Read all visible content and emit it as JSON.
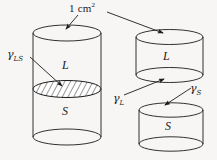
{
  "figure": {
    "type": "scientific-diagram",
    "background_color": "#f7f6f4",
    "stroke_color": "#1b1b1b",
    "labels": {
      "area": "1 cm",
      "area_exponent": "2",
      "gamma_symbol": "γ",
      "gamma_ls_sub": "LS",
      "gamma_l_sub": "L",
      "gamma_s_sub": "S",
      "phase_liquid": "L",
      "phase_solid": "S"
    },
    "elements": {
      "left_cylinder": {
        "name": "combined-cylinder",
        "top_phase": "L",
        "bottom_phase": "S",
        "interface": "hatched-ellipse",
        "interface_label": "gamma-LS"
      },
      "right_upper_cylinder": {
        "name": "liquid-cylinder",
        "phase": "L",
        "surface_label": "gamma-L"
      },
      "right_lower_cylinder": {
        "name": "solid-cylinder",
        "phase": "S",
        "surface_label": "gamma-S"
      }
    },
    "annotations": [
      {
        "label": "1 cm²",
        "points_to": "left-cylinder-top-face"
      },
      {
        "label": "1 cm²",
        "points_to": "right-upper-cylinder-top-face"
      },
      {
        "label": "γLS",
        "points_to": "hatched-interface"
      },
      {
        "label": "γL",
        "points_to": "liquid-cylinder-bottom-face"
      },
      {
        "label": "γS",
        "points_to": "solid-cylinder-top-face"
      }
    ]
  }
}
